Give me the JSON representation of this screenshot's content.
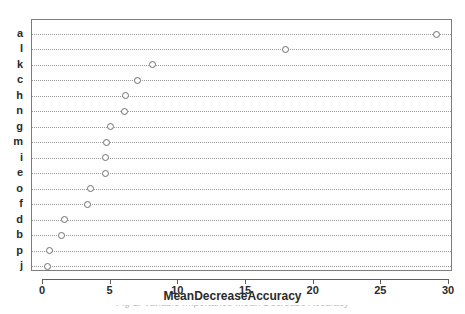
{
  "chart_data": {
    "type": "scatter",
    "title": "",
    "xlabel": "MeanDecreaseAccuracy",
    "ylabel": "",
    "xlim": [
      -1.0,
      30.4
    ],
    "xticks": [
      0,
      5,
      10,
      15,
      20,
      25,
      30
    ],
    "xticklabels": [
      "0",
      "5",
      "10",
      "15",
      "20",
      "25",
      "30"
    ],
    "grid": "horizontal-dotted",
    "legend": "none",
    "marker": "open-circle",
    "categories": [
      "a",
      "l",
      "k",
      "c",
      "h",
      "n",
      "g",
      "m",
      "i",
      "e",
      "o",
      "f",
      "d",
      "b",
      "p",
      "j"
    ],
    "values": [
      29.1,
      17.9,
      8.1,
      7.0,
      6.1,
      6.0,
      5.0,
      4.7,
      4.6,
      4.6,
      3.5,
      3.3,
      1.6,
      1.4,
      0.5,
      0.3
    ],
    "points": [
      {
        "label": "a",
        "value": 29.1
      },
      {
        "label": "l",
        "value": 17.9
      },
      {
        "label": "k",
        "value": 8.1
      },
      {
        "label": "c",
        "value": 7.0
      },
      {
        "label": "h",
        "value": 6.1
      },
      {
        "label": "n",
        "value": 6.0
      },
      {
        "label": "g",
        "value": 5.0
      },
      {
        "label": "m",
        "value": 4.7
      },
      {
        "label": "i",
        "value": 4.6
      },
      {
        "label": "e",
        "value": 4.6
      },
      {
        "label": "o",
        "value": 3.5
      },
      {
        "label": "f",
        "value": 3.3
      },
      {
        "label": "d",
        "value": 1.6
      },
      {
        "label": "b",
        "value": 1.4
      },
      {
        "label": "p",
        "value": 0.5
      },
      {
        "label": "j",
        "value": 0.3
      }
    ]
  },
  "caption": {
    "text": "Fig 1.  Variable Importance Mean Decrease Accuracy"
  },
  "colors": {
    "frame": "#7d7d7d",
    "grid": "#9a9a9a",
    "marker_stroke": "#6e6e6e",
    "text": "#2b2b2b",
    "background": "#ffffff"
  }
}
